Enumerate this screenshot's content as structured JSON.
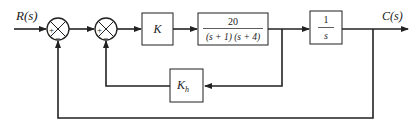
{
  "diagram": {
    "type": "block-diagram",
    "input_label": "R(s)",
    "output_label": "C(s)",
    "summing_junctions": [
      {
        "id": "sum1",
        "signs": {
          "left": "+",
          "bottom": "−"
        }
      },
      {
        "id": "sum2",
        "signs": {
          "left": "+",
          "bottom": "−"
        }
      }
    ],
    "blocks": {
      "gain": {
        "label": "K"
      },
      "plant": {
        "numerator": "20",
        "denominator": "(s + 1) (s + 4)"
      },
      "integrator": {
        "numerator": "1",
        "denominator": "s"
      },
      "feedback_gain": {
        "label": "K",
        "subscript": "h"
      }
    },
    "connections": [
      "R(s) → sum1(+)",
      "sum1 → sum2(+)",
      "sum2 → K",
      "K → 20/((s+1)(s+4))",
      "20/((s+1)(s+4)) → 1/s",
      "1/s → C(s)",
      "plant output → Kh → sum2(−)",
      "C(s) → sum1(−)"
    ],
    "colors": {
      "line": "#222222",
      "background": "#ffffff"
    }
  }
}
